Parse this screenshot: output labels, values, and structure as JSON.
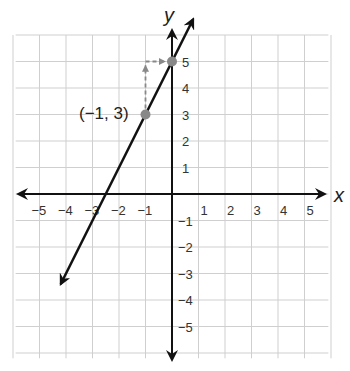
{
  "chart_data": {
    "type": "line",
    "title": "",
    "xlabel": "x",
    "ylabel": "y",
    "xlim": [
      -6,
      6
    ],
    "ylim": [
      -6,
      6
    ],
    "grid": true,
    "x_ticks": [
      "−5",
      "−4",
      "−3",
      "−2",
      "−1",
      "1",
      "2",
      "3",
      "4",
      "5"
    ],
    "y_ticks": [
      "5",
      "4",
      "3",
      "2",
      "1",
      "−1",
      "−2",
      "−3",
      "−4",
      "−5"
    ],
    "series": [
      {
        "name": "line",
        "equation": "y = 2x + 5",
        "x": [
          -4.2,
          0.8
        ],
        "y": [
          -3.4,
          6.6
        ],
        "color": "#111111"
      }
    ],
    "points": [
      {
        "x": -1,
        "y": 3,
        "label": "(−1, 3)",
        "color": "#888888"
      },
      {
        "x": 0,
        "y": 5,
        "label": "",
        "color": "#888888"
      }
    ],
    "annotations": [
      {
        "type": "dashed-arrow",
        "from": [
          -1,
          3
        ],
        "to": [
          -1,
          5
        ],
        "meaning": "rise 2"
      },
      {
        "type": "dashed-arrow",
        "from": [
          -1,
          5
        ],
        "to": [
          0,
          5
        ],
        "meaning": "run 1"
      }
    ]
  },
  "labels": {
    "x_axis": "x",
    "y_axis": "y",
    "point_label": "(−1, 3)"
  }
}
